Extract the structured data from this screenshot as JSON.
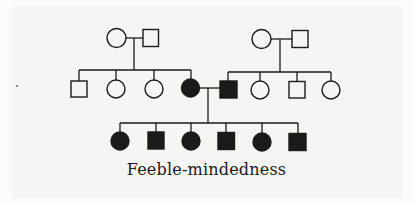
{
  "title": "Feeble-mindedness",
  "colors": {
    "ink": "#1a1a1a",
    "background": "#f5f5f3",
    "unaffected_fill": "#f5f5f3",
    "affected_fill": "#1a1a1a"
  },
  "legend": {
    "circle": "female",
    "square": "male",
    "filled": "affected",
    "open": "unaffected"
  },
  "pedigree": {
    "generation_1": [
      {
        "id": "I-1",
        "sex": "female",
        "affected": false
      },
      {
        "id": "I-2",
        "sex": "male",
        "affected": false
      },
      {
        "id": "I-3",
        "sex": "female",
        "affected": false
      },
      {
        "id": "I-4",
        "sex": "male",
        "affected": false
      }
    ],
    "generation_2": [
      {
        "id": "II-1",
        "sex": "male",
        "affected": false,
        "parents": [
          "I-1",
          "I-2"
        ]
      },
      {
        "id": "II-2",
        "sex": "female",
        "affected": false,
        "parents": [
          "I-1",
          "I-2"
        ]
      },
      {
        "id": "II-3",
        "sex": "female",
        "affected": false,
        "parents": [
          "I-1",
          "I-2"
        ]
      },
      {
        "id": "II-4",
        "sex": "female",
        "affected": true,
        "parents": [
          "I-1",
          "I-2"
        ]
      },
      {
        "id": "II-5",
        "sex": "male",
        "affected": true,
        "parents": [
          "I-3",
          "I-4"
        ]
      },
      {
        "id": "II-6",
        "sex": "female",
        "affected": false,
        "parents": [
          "I-3",
          "I-4"
        ]
      },
      {
        "id": "II-7",
        "sex": "male",
        "affected": false,
        "parents": [
          "I-3",
          "I-4"
        ]
      },
      {
        "id": "II-8",
        "sex": "female",
        "affected": false,
        "parents": [
          "I-3",
          "I-4"
        ]
      }
    ],
    "generation_3": [
      {
        "id": "III-1",
        "sex": "female",
        "affected": true,
        "parents": [
          "II-4",
          "II-5"
        ]
      },
      {
        "id": "III-2",
        "sex": "male",
        "affected": true,
        "parents": [
          "II-4",
          "II-5"
        ]
      },
      {
        "id": "III-3",
        "sex": "female",
        "affected": true,
        "parents": [
          "II-4",
          "II-5"
        ]
      },
      {
        "id": "III-4",
        "sex": "male",
        "affected": true,
        "parents": [
          "II-4",
          "II-5"
        ]
      },
      {
        "id": "III-5",
        "sex": "female",
        "affected": true,
        "parents": [
          "II-4",
          "II-5"
        ]
      },
      {
        "id": "III-6",
        "sex": "male",
        "affected": true,
        "parents": [
          "II-4",
          "II-5"
        ]
      }
    ]
  }
}
